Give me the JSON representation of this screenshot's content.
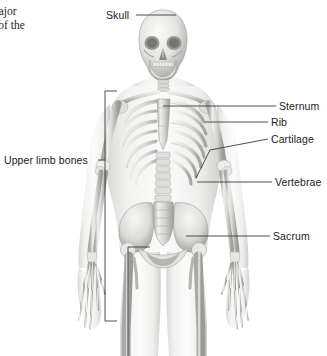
{
  "figure": {
    "title_fragment_line1": "najor",
    "title_fragment_line2": "s of the",
    "view": "anterior-skeleton-view",
    "background_color": "#ffffff",
    "label_color": "#1c1c1c",
    "leader_line_color": "#3a3a3a",
    "bone_light": "#f2f2f0",
    "bone_mid": "#c9c9c6",
    "bone_shadow": "#8e8e8b",
    "body_tint": "#d8d8d6"
  },
  "labels": {
    "skull": "Skull",
    "sternum": "Sternum",
    "rib": "Rib",
    "cartilage": "Cartilage",
    "vertebrae": "Vertebrae",
    "sacrum": "Sacrum",
    "upper_limb_bones": "Upper limb bones"
  },
  "icon_names": {
    "skull_leader": "leader-line-icon",
    "bracket_upper": "bracket-icon",
    "bracket_lower": "bracket-icon"
  }
}
